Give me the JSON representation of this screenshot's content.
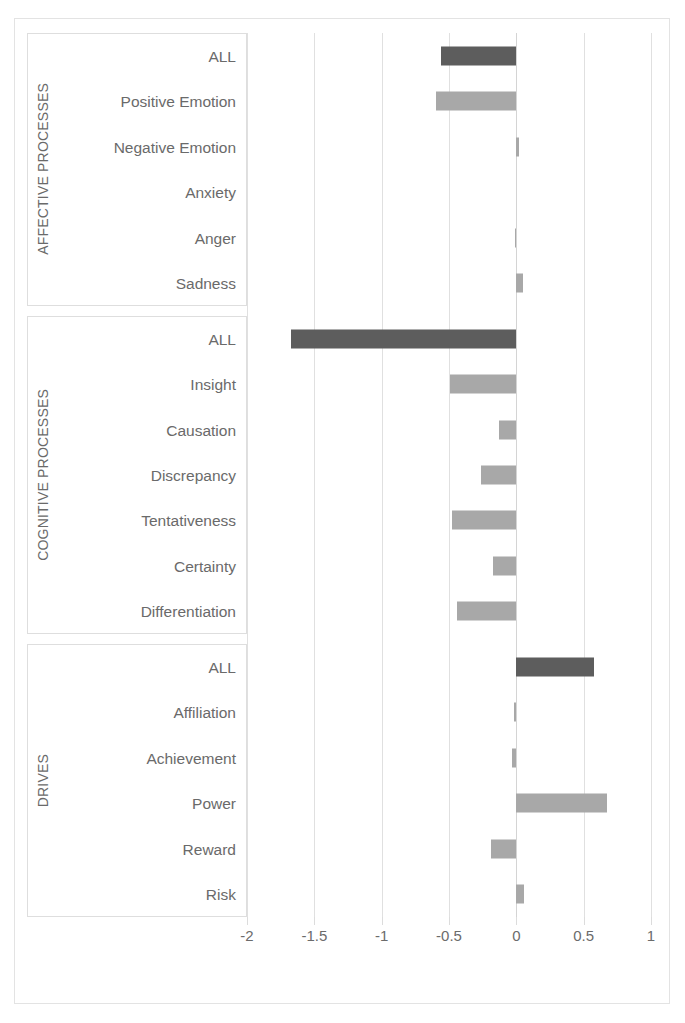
{
  "chart_data": {
    "type": "bar",
    "orientation": "horizontal",
    "title": "",
    "xlabel": "",
    "ylabel": "",
    "xlim": [
      -2,
      1
    ],
    "grid": true,
    "legend": false,
    "xticks": [
      "-2",
      "-1.5",
      "-1",
      "-0.5",
      "0",
      "0.5",
      "1"
    ],
    "xtick_values": [
      -2,
      -1.5,
      -1,
      -0.5,
      0,
      0.5,
      1
    ],
    "colors": {
      "all_bar": "#5d5d5d",
      "sub_bar": "#a8a8a8",
      "gridline": "#e0e0e0",
      "frame": "#e3e3e3",
      "text": "#6a6a6a"
    },
    "groups": [
      {
        "name": "AFFECTIVE PROCESSES",
        "categories": [
          "ALL",
          "Positive Emotion",
          "Negative Emotion",
          "Anxiety",
          "Anger",
          "Sadness"
        ],
        "values": [
          -0.56,
          -0.6,
          0.02,
          0.0,
          -0.01,
          0.05
        ],
        "kinds": [
          "all",
          "sub",
          "sub",
          "sub",
          "sub",
          "sub"
        ]
      },
      {
        "name": "COGNITIVE PROCESSES",
        "categories": [
          "ALL",
          "Insight",
          "Causation",
          "Discrepancy",
          "Tentativeness",
          "Certainty",
          "Differentiation"
        ],
        "values": [
          -1.67,
          -0.49,
          -0.13,
          -0.26,
          -0.48,
          -0.17,
          -0.44
        ],
        "kinds": [
          "all",
          "sub",
          "sub",
          "sub",
          "sub",
          "sub",
          "sub"
        ]
      },
      {
        "name": "DRIVES",
        "categories": [
          "ALL",
          "Affiliation",
          "Achievement",
          "Power",
          "Reward",
          "Risk"
        ],
        "values": [
          0.58,
          -0.02,
          -0.03,
          0.67,
          -0.19,
          0.06
        ],
        "kinds": [
          "all",
          "sub",
          "sub",
          "sub",
          "sub",
          "sub"
        ]
      }
    ]
  }
}
